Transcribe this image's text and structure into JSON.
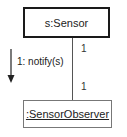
{
  "diagram": {
    "type": "uml-communication",
    "objects": [
      {
        "id": "sensor",
        "label": "s:Sensor",
        "underlined": false
      },
      {
        "id": "observer",
        "label": ":SensorObserver",
        "underlined": true
      }
    ],
    "link": {
      "from": "sensor",
      "to": "observer",
      "multiplicity_from": "1",
      "multiplicity_to": "1"
    },
    "message": {
      "label": "1: notify(s)",
      "direction": "down"
    },
    "colors": {
      "box_border_primary": "#1a1a1a",
      "box_border_secondary": "#777777",
      "line": "#555555",
      "text": "#222222"
    }
  }
}
